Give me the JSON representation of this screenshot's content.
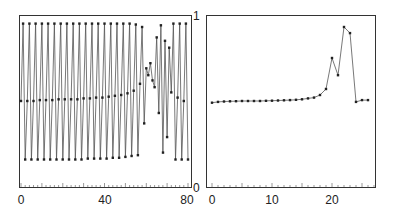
{
  "chart_data": [
    {
      "type": "line",
      "title": "",
      "xlabel": "",
      "ylabel": "",
      "xlim": [
        0,
        80
      ],
      "ylim": [
        0,
        1
      ],
      "xticks": [
        "0",
        "40",
        "80"
      ],
      "yticks_right": [
        "0",
        "1"
      ],
      "grid": false,
      "markers": true,
      "x": [
        0,
        1,
        2,
        3,
        4,
        5,
        6,
        7,
        8,
        9,
        10,
        11,
        12,
        13,
        14,
        15,
        16,
        17,
        18,
        19,
        20,
        21,
        22,
        23,
        24,
        25,
        26,
        27,
        28,
        29,
        30,
        31,
        32,
        33,
        34,
        35,
        36,
        37,
        38,
        39,
        40,
        41,
        42,
        43,
        44,
        45,
        46,
        47,
        48,
        49,
        50,
        51,
        52,
        53,
        54,
        55,
        56,
        57,
        58,
        59,
        60,
        61,
        62,
        63,
        64,
        65,
        66,
        67,
        68,
        69,
        70,
        71,
        72,
        73,
        74,
        75,
        76,
        77,
        78,
        79,
        80
      ],
      "values": [
        0.5,
        0.95,
        0.16,
        0.5,
        0.95,
        0.16,
        0.5,
        0.95,
        0.16,
        0.505,
        0.95,
        0.16,
        0.505,
        0.95,
        0.16,
        0.505,
        0.95,
        0.16,
        0.51,
        0.95,
        0.16,
        0.51,
        0.95,
        0.16,
        0.51,
        0.95,
        0.16,
        0.51,
        0.95,
        0.16,
        0.515,
        0.95,
        0.165,
        0.515,
        0.95,
        0.165,
        0.52,
        0.95,
        0.165,
        0.52,
        0.95,
        0.165,
        0.525,
        0.95,
        0.17,
        0.53,
        0.95,
        0.17,
        0.535,
        0.95,
        0.175,
        0.545,
        0.95,
        0.18,
        0.56,
        0.945,
        0.185,
        0.6,
        0.93,
        0.37,
        0.69,
        0.65,
        0.72,
        0.62,
        0.58,
        0.87,
        0.43,
        0.94,
        0.2,
        0.85,
        0.29,
        0.81,
        0.55,
        0.95,
        0.16,
        0.52,
        0.95,
        0.16,
        0.5,
        0.95,
        0.16
      ],
      "series_color": "#333333"
    },
    {
      "type": "line",
      "title": "",
      "xlabel": "",
      "ylabel": "",
      "xlim": [
        0,
        27
      ],
      "ylim": [
        0,
        1
      ],
      "xticks": [
        "0",
        "10",
        "20"
      ],
      "grid": false,
      "markers": true,
      "x": [
        0,
        1,
        2,
        3,
        4,
        5,
        6,
        7,
        8,
        9,
        10,
        11,
        12,
        13,
        14,
        15,
        16,
        17,
        18,
        19,
        20,
        21,
        22,
        23,
        24,
        25,
        26
      ],
      "values": [
        0.49,
        0.495,
        0.497,
        0.498,
        0.499,
        0.5,
        0.5,
        0.5,
        0.5,
        0.501,
        0.502,
        0.503,
        0.504,
        0.505,
        0.507,
        0.51,
        0.515,
        0.52,
        0.535,
        0.57,
        0.75,
        0.65,
        0.93,
        0.895,
        0.495,
        0.505,
        0.505
      ],
      "series_color": "#333333"
    }
  ],
  "axes": {
    "left": {
      "xtick_labels": [
        "0",
        "40",
        "80"
      ],
      "right_labels": [
        "1",
        "0"
      ]
    },
    "right": {
      "xtick_labels": [
        "0",
        "10",
        "20"
      ]
    }
  }
}
